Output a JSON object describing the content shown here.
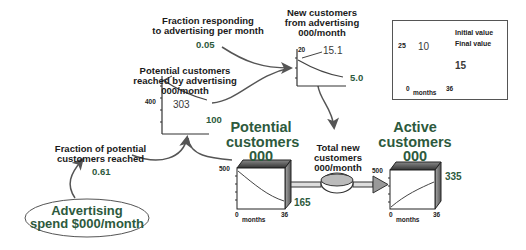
{
  "colors": {
    "accent_green": "#2d5a3d",
    "line": "#444444",
    "stock_top": "#3a3a3a"
  },
  "nodes": {
    "fraction_responding": {
      "label_line1": "Fraction responding",
      "label_line2": "to advertising per month",
      "value": "0.05"
    },
    "potential_reached": {
      "label_line1": "Potential customers",
      "label_line2": "reached by advertising",
      "label_line3": "000/month",
      "y_max": "400",
      "initial": "303",
      "final": "100"
    },
    "new_customers": {
      "label_line1": "New customers",
      "label_line2": "from advertising",
      "label_line3": "000/month",
      "y_max": "20",
      "initial": "15.1",
      "final": "5.0"
    },
    "fraction_reached": {
      "label_line1": "Fraction of potential",
      "label_line2": "customers reached",
      "value": "0.61"
    },
    "advertising_spend": {
      "label_line1": "Advertising",
      "label_line2": "spend $000/month"
    },
    "potential_stock": {
      "label_line1": "Potential",
      "label_line2": "customers",
      "label_line3": "000",
      "y_max": "500",
      "x_min": "0",
      "x_max": "36",
      "x_label": "months",
      "final": "165"
    },
    "total_new_flow": {
      "label_line1": "Total new",
      "label_line2": "customers",
      "label_line3": "000/month"
    },
    "active_stock": {
      "label_line1": "Active",
      "label_line2": "customers",
      "label_line3": "000",
      "y_max": "500",
      "x_min": "0",
      "x_max": "36",
      "x_label": "months",
      "final": "335"
    }
  },
  "legend": {
    "y_max": "25",
    "initial": "10",
    "final": "15",
    "initial_label": "Initial value",
    "final_label": "Final value",
    "x_min": "0",
    "x_max": "36",
    "x_label": "months"
  }
}
